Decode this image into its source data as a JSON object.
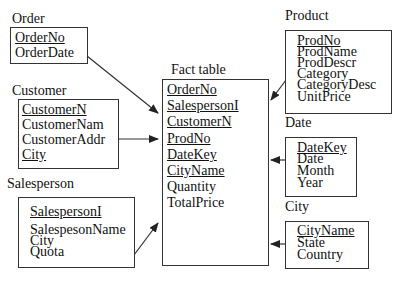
{
  "tables": {
    "order": {
      "title": "Order",
      "fields": [
        {
          "name": "OrderNo",
          "key": true
        },
        {
          "name": "OrderDate",
          "key": false
        }
      ]
    },
    "customer": {
      "title": "Customer",
      "fields": [
        {
          "name": "CustomerN",
          "key": true
        },
        {
          "name": "CustomerNam",
          "key": false
        },
        {
          "name": "CustomerAddr",
          "key": false
        },
        {
          "name": "City",
          "key": true
        }
      ]
    },
    "salesperson": {
      "title": "Salesperson",
      "fields": [
        {
          "name": "SalespersonI",
          "key": true
        },
        {
          "name": "SalespesonName",
          "key": false
        },
        {
          "name": "City",
          "key": false
        },
        {
          "name": "Quota",
          "key": false
        }
      ]
    },
    "fact": {
      "title": "Fact table",
      "fields": [
        {
          "name": "OrderNo",
          "key": true
        },
        {
          "name": "SalespersonI",
          "key": true
        },
        {
          "name": "CustomerN",
          "key": true
        },
        {
          "name": "ProdNo",
          "key": true
        },
        {
          "name": "DateKey",
          "key": true
        },
        {
          "name": "CityName",
          "key": true
        },
        {
          "name": "Quantity",
          "key": false
        },
        {
          "name": "TotalPrice",
          "key": false
        }
      ]
    },
    "product": {
      "title": "Product",
      "fields": [
        {
          "name": "ProdNo",
          "key": true
        },
        {
          "name": "ProdName",
          "key": false
        },
        {
          "name": "ProdDescr",
          "key": false
        },
        {
          "name": "Category",
          "key": false
        },
        {
          "name": "CategoryDesc",
          "key": false
        },
        {
          "name": "UnitPrice",
          "key": false
        }
      ]
    },
    "date": {
      "title": "Date",
      "fields": [
        {
          "name": "DateKey",
          "key": true
        },
        {
          "name": "Date",
          "key": false
        },
        {
          "name": "Month",
          "key": false
        },
        {
          "name": "Year",
          "key": false
        }
      ]
    },
    "city": {
      "title": "City",
      "fields": [
        {
          "name": "CityName",
          "key": true
        },
        {
          "name": "State",
          "key": false
        },
        {
          "name": "Country",
          "key": false
        }
      ]
    }
  },
  "colors": {
    "line": "#333333",
    "text": "#111111"
  }
}
